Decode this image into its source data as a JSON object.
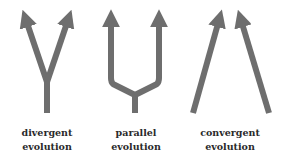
{
  "diagram": {
    "stroke_color": "#6e6e6e",
    "items": [
      {
        "label_line1": "divergent",
        "label_line2": "evolution"
      },
      {
        "label_line1": "parallel",
        "label_line2": "evolution"
      },
      {
        "label_line1": "convergent",
        "label_line2": "evolution"
      }
    ]
  }
}
